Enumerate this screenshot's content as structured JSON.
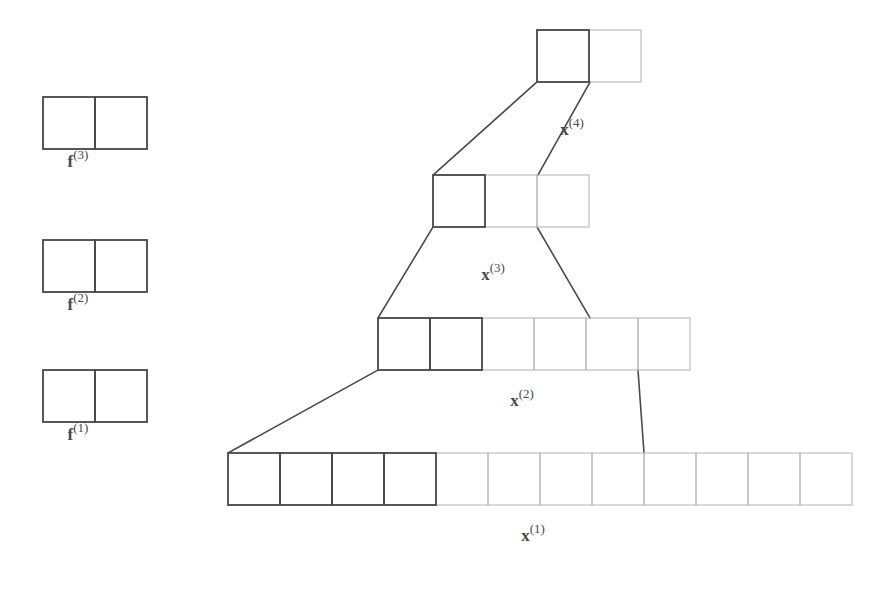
{
  "figure": {
    "background_color": "#ffffff",
    "stroke_dark": "#4a4a4a",
    "stroke_light": "#b9b9b9",
    "label_color": "#4a4a4a"
  },
  "filters": [
    {
      "id": "filter-3",
      "label_base": "f",
      "label_sup": "(3)",
      "cells": 2,
      "highlighted_cells": 2,
      "x": 43,
      "y": 97,
      "cell_w": 52,
      "cell_h": 52
    },
    {
      "id": "filter-2",
      "label_base": "f",
      "label_sup": "(2)",
      "cells": 2,
      "highlighted_cells": 2,
      "x": 43,
      "y": 240,
      "cell_w": 52,
      "cell_h": 52
    },
    {
      "id": "filter-1",
      "label_base": "f",
      "label_sup": "(1)",
      "cells": 2,
      "highlighted_cells": 2,
      "x": 43,
      "y": 370,
      "cell_w": 52,
      "cell_h": 52
    }
  ],
  "filter_labels": [
    {
      "id": "filter-label-3",
      "base": "f",
      "sup": "(3)",
      "x": 78,
      "y": 160
    },
    {
      "id": "filter-label-2",
      "base": "f",
      "sup": "(2)",
      "x": 78,
      "y": 303
    },
    {
      "id": "filter-label-1",
      "base": "f",
      "sup": "(1)",
      "x": 78,
      "y": 433
    }
  ],
  "layers": [
    {
      "id": "layer-x1",
      "label_base": "x",
      "label_sup": "(1)",
      "cells": 12,
      "highlighted_cells": 4,
      "x": 228,
      "y": 453,
      "cell_w": 52,
      "cell_h": 52,
      "label_x": 533,
      "label_y": 534
    },
    {
      "id": "layer-x2",
      "label_base": "x",
      "label_sup": "(2)",
      "cells": 6,
      "highlighted_cells": 2,
      "x": 378,
      "y": 318,
      "cell_w": 52,
      "cell_h": 52,
      "label_x": 522,
      "label_y": 399,
      "_comment_label": "label sits inside trapezoid below row"
    },
    {
      "id": "layer-x3",
      "label_base": "x",
      "label_sup": "(3)",
      "cells": 3,
      "highlighted_cells": 1,
      "x": 433,
      "y": 175,
      "cell_w": 52,
      "cell_h": 52,
      "label_x": 493,
      "label_y": 273
    },
    {
      "id": "layer-x4",
      "label_base": "x",
      "label_sup": "(4)",
      "cells": 2,
      "highlighted_cells": 1,
      "x": 537,
      "y": 30,
      "cell_w": 52,
      "cell_h": 52,
      "label_x": 572,
      "label_y": 128
    }
  ],
  "connectors": [
    {
      "id": "connector-1-to-2",
      "from_layer": "layer-x1",
      "to_layer": "layer-x2",
      "left_bottom_x": 228,
      "left_bottom_y": 453,
      "left_top_x": 378,
      "left_top_y": 370,
      "right_top_x": 638,
      "right_top_y": 370,
      "right_bottom_x": 644,
      "right_bottom_y": 453
    },
    {
      "id": "connector-2-to-3",
      "from_layer": "layer-x2",
      "to_layer": "layer-x3",
      "left_bottom_x": 378,
      "left_bottom_y": 318,
      "left_top_x": 433,
      "left_top_y": 227,
      "right_top_x": 537,
      "right_top_y": 227,
      "right_bottom_x": 590,
      "right_bottom_y": 318
    },
    {
      "id": "connector-3-to-4",
      "from_layer": "layer-x3",
      "to_layer": "layer-x4",
      "left_bottom_x": 433,
      "left_bottom_y": 175,
      "left_top_x": 537,
      "left_top_y": 82,
      "right_top_x": 590,
      "right_top_y": 82,
      "right_bottom_x": 538,
      "right_bottom_y": 175
    }
  ]
}
